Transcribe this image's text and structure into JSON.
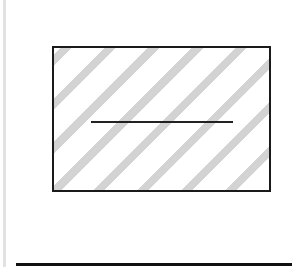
{
  "diagram": {
    "shapes": [
      {
        "type": "vertical-bar",
        "color": "#e2e2e2"
      },
      {
        "type": "rectangle",
        "fill": "diagonal-hatch",
        "hatch_color": "#d3d3d3",
        "border_color": "#1a1a1a"
      },
      {
        "type": "horizontal-line",
        "inside": "rectangle",
        "color": "#222222"
      },
      {
        "type": "horizontal-line",
        "position": "bottom",
        "color": "#111111"
      }
    ],
    "text": []
  }
}
